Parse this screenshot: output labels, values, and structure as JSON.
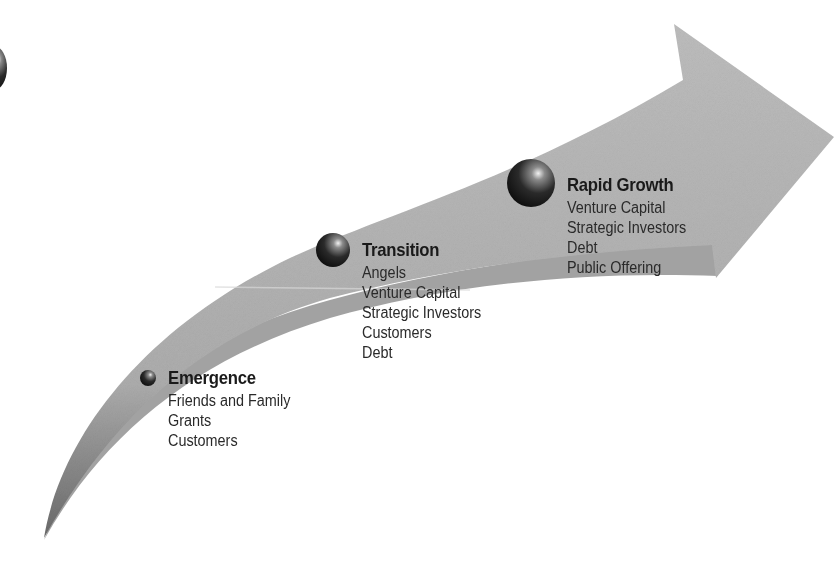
{
  "diagram": {
    "type": "growth-arrow",
    "colors": {
      "arrow_fill": "#b4b4b4",
      "arrow_shadow": "#4a4a4a",
      "sphere": "#1c1c1c",
      "text": "#222222"
    },
    "stages": [
      {
        "title": "Emergence",
        "items": [
          "Friends and Family",
          "Grants",
          "Customers"
        ]
      },
      {
        "title": "Transition",
        "items": [
          "Angels",
          "Venture Capital",
          "Strategic Investors",
          "Customers",
          "Debt"
        ]
      },
      {
        "title": "Rapid Growth",
        "items": [
          "Venture Capital",
          "Strategic Investors",
          "Debt",
          "Public Offering"
        ]
      }
    ]
  }
}
